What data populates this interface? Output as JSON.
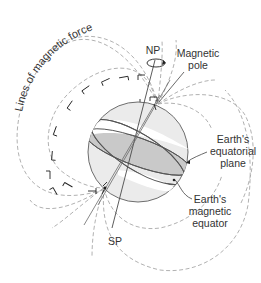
{
  "diagram": {
    "labels": {
      "lines_of_force": "Lines of magnetic force",
      "north_pole": "NP",
      "south_pole": "SP",
      "magnetic_pole_line1": "Magnetic",
      "magnetic_pole_line2": "pole",
      "equatorial_plane_line1": "Earth's",
      "equatorial_plane_line2": "equatorial",
      "equatorial_plane_line3": "plane",
      "magnetic_equator_line1": "Earth's",
      "magnetic_equator_line2": "magnetic",
      "magnetic_equator_line3": "equator"
    },
    "colors": {
      "globe_fill": "#ebebeb",
      "globe_stroke": "#6e6e6e",
      "equatorial_plane_fill": "#c9c9c9",
      "field_lines": "#a8a8a8",
      "text": "#333333"
    },
    "icons": [
      "rotation-arrow-icon",
      "field-direction-arrow-icon"
    ]
  }
}
